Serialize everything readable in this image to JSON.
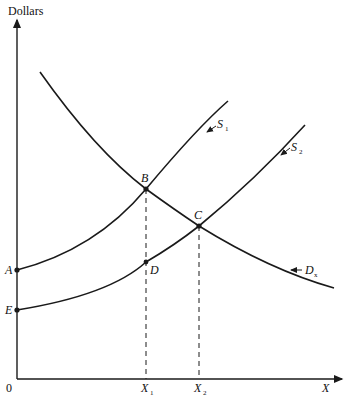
{
  "diagram": {
    "y_axis_label": "Dollars",
    "x_axis_label": "X",
    "origin_label": "0",
    "curves": [
      {
        "name": "S1",
        "label": "S",
        "sub": "1"
      },
      {
        "name": "S2",
        "label": "S",
        "sub": "2"
      },
      {
        "name": "Dx",
        "label": "D",
        "sub": "x"
      }
    ],
    "points": {
      "A": "A",
      "B": "B",
      "C": "C",
      "D": "D",
      "E": "E"
    },
    "x_ticks": [
      {
        "label": "X",
        "sub": "1"
      },
      {
        "label": "X",
        "sub": "2"
      }
    ],
    "colors": {
      "line": "#1a1a1a",
      "background": "#ffffff"
    }
  }
}
